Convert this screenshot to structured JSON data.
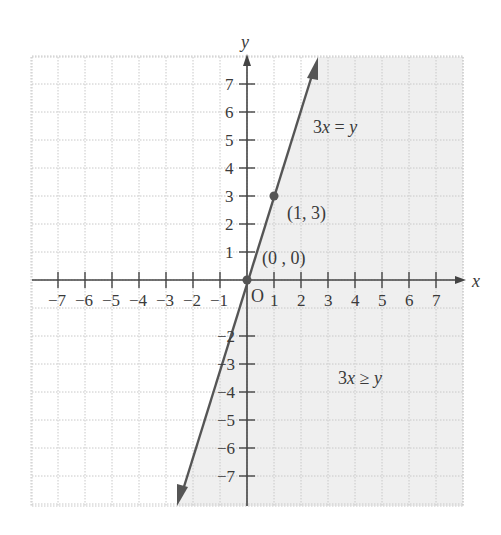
{
  "chart_data": {
    "type": "line",
    "title": "",
    "xlabel": "x",
    "ylabel": "y",
    "xlim": [
      -8,
      8
    ],
    "ylim": [
      -8,
      8
    ],
    "grid": true,
    "x_ticks": [
      "-7",
      "-6",
      "-5",
      "-4",
      "-3",
      "-2",
      "-1",
      "1",
      "2",
      "3",
      "4",
      "5",
      "6",
      "7"
    ],
    "y_ticks": [
      "7",
      "6",
      "5",
      "4",
      "3",
      "2",
      "1",
      "-2",
      "-3",
      "-4",
      "-5",
      "-6",
      "-7"
    ],
    "origin_label": "O",
    "series": [
      {
        "name": "3x = y",
        "equation": "y = 3x",
        "x": [
          -2.6,
          0,
          1,
          2.6
        ],
        "y": [
          -7.9,
          0,
          3,
          7.9
        ]
      }
    ],
    "points": [
      {
        "label": "(0 , 0)",
        "x": 0,
        "y": 0
      },
      {
        "label": "(1, 3)",
        "x": 1,
        "y": 3
      }
    ],
    "shaded_region": {
      "inequality": "3x ≥ y",
      "side": "right of line"
    },
    "annotations": [
      {
        "text": "3x = y",
        "x": 2.4,
        "y": 5.6
      },
      {
        "text": "3x ≥ y",
        "x": 3.4,
        "y": -3.6
      }
    ],
    "colors": {
      "line": "#555555",
      "shade": "#efefef",
      "grid": "#cccccc",
      "axis": "#444444"
    }
  },
  "labels": {
    "x_axis": "x",
    "y_axis": "y",
    "origin": "O",
    "point_origin": "(0 , 0)",
    "point_13": "(1, 3)",
    "line_eq_3x": "3",
    "line_eq_x": "x",
    "line_eq_rest": " = ",
    "line_eq_y": "y",
    "ineq_3": "3",
    "ineq_x": "x",
    "ineq_op": " ≥ ",
    "ineq_y": "y",
    "x_ticks": [
      "−7",
      "−6",
      "−5",
      "−4",
      "−3",
      "−2",
      "−1",
      "1",
      "2",
      "3",
      "4",
      "5",
      "6",
      "7"
    ],
    "y_ticks_pos": [
      "1",
      "2",
      "3",
      "4",
      "5",
      "6",
      "7"
    ],
    "y_ticks_neg": [
      "−2",
      "−3",
      "−4",
      "−5",
      "−6",
      "−7"
    ]
  }
}
